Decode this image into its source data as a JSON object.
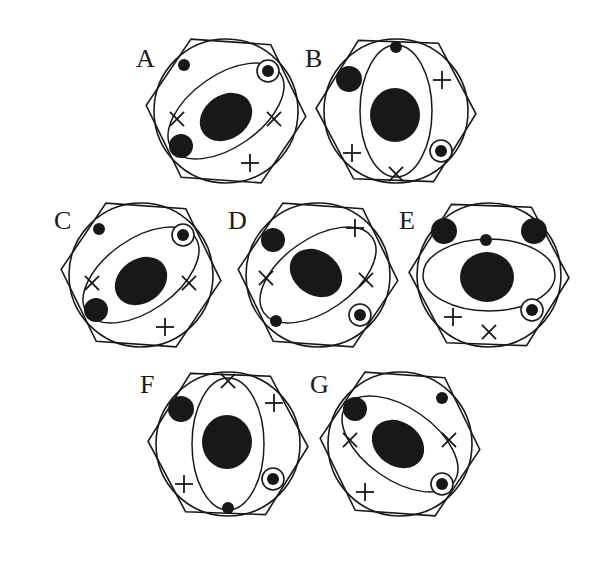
{
  "figure": {
    "background_color": "#ffffff",
    "ink_color": "#181818",
    "panel_count": 7,
    "label_font_style": "serif-capital"
  },
  "panels": [
    {
      "id": "A",
      "label": "A",
      "label_x": 136,
      "label_y": 46,
      "center_x": 226,
      "center_y": 111,
      "circle_radius": 72,
      "hex_radius": 80,
      "hex_rotation_deg": 4,
      "core": {
        "rx": 28,
        "ry": 22,
        "rot": -35,
        "cx": 0,
        "cy": 6
      },
      "orbit": {
        "rx": 66,
        "ry": 36,
        "rot": -35
      },
      "small_dot": {
        "x": -42,
        "y": -46,
        "r": 6
      },
      "medium_dot": {
        "x": -45,
        "y": 35,
        "r": 12
      },
      "ring_dot": {
        "x": 42,
        "y": -40,
        "r_outer": 11,
        "r_inner": 6
      },
      "marks": [
        {
          "glyph": "×",
          "x": -49,
          "y": 8
        },
        {
          "glyph": "×",
          "x": 48,
          "y": 8
        },
        {
          "glyph": "+",
          "x": 24,
          "y": 52
        }
      ]
    },
    {
      "id": "B",
      "label": "B",
      "label_x": 305,
      "label_y": 46,
      "center_x": 396,
      "center_y": 111,
      "circle_radius": 72,
      "hex_radius": 80,
      "hex_rotation_deg": 2,
      "core": {
        "rx": 25,
        "ry": 27,
        "rot": 0,
        "cx": -1,
        "cy": 4
      },
      "orbit": {
        "rx": 36,
        "ry": 66,
        "rot": 0
      },
      "small_dot": {
        "x": 0,
        "y": -64,
        "r": 6
      },
      "medium_dot": {
        "x": -47,
        "y": -32,
        "r": 13
      },
      "ring_dot": {
        "x": 45,
        "y": 40,
        "r_outer": 11,
        "r_inner": 6
      },
      "marks": [
        {
          "glyph": "+",
          "x": 46,
          "y": -31
        },
        {
          "glyph": "+",
          "x": -44,
          "y": 42
        },
        {
          "glyph": "×",
          "x": 0,
          "y": 63
        }
      ]
    },
    {
      "id": "C",
      "label": "C",
      "label_x": 54,
      "label_y": 208,
      "center_x": 141,
      "center_y": 275,
      "circle_radius": 72,
      "hex_radius": 80,
      "hex_rotation_deg": 4,
      "core": {
        "rx": 28,
        "ry": 22,
        "rot": -35,
        "cx": 0,
        "cy": 6
      },
      "orbit": {
        "rx": 66,
        "ry": 36,
        "rot": -35
      },
      "small_dot": {
        "x": -42,
        "y": -46,
        "r": 6
      },
      "medium_dot": {
        "x": -45,
        "y": 35,
        "r": 12
      },
      "ring_dot": {
        "x": 42,
        "y": -40,
        "r_outer": 11,
        "r_inner": 6
      },
      "marks": [
        {
          "glyph": "×",
          "x": -49,
          "y": 8
        },
        {
          "glyph": "×",
          "x": 48,
          "y": 8
        },
        {
          "glyph": "+",
          "x": 24,
          "y": 52
        }
      ]
    },
    {
      "id": "D",
      "label": "D",
      "label_x": 228,
      "label_y": 208,
      "center_x": 318,
      "center_y": 275,
      "circle_radius": 72,
      "hex_radius": 80,
      "hex_rotation_deg": 4,
      "core": {
        "rx": 28,
        "ry": 22,
        "rot": 35,
        "cx": -2,
        "cy": -2
      },
      "orbit": {
        "rx": 66,
        "ry": 36,
        "rot": -35
      },
      "small_dot": {
        "x": -42,
        "y": 46,
        "r": 6
      },
      "medium_dot": {
        "x": -45,
        "y": -35,
        "r": 12
      },
      "ring_dot": {
        "x": 42,
        "y": 40,
        "r_outer": 11,
        "r_inner": 6
      },
      "marks": [
        {
          "glyph": "×",
          "x": -52,
          "y": 3
        },
        {
          "glyph": "×",
          "x": 48,
          "y": 5
        },
        {
          "glyph": "+",
          "x": 37,
          "y": -47
        }
      ]
    },
    {
      "id": "E",
      "label": "E",
      "label_x": 399,
      "label_y": 208,
      "center_x": 489,
      "center_y": 275,
      "circle_radius": 72,
      "hex_radius": 80,
      "hex_rotation_deg": 2,
      "core": {
        "rx": 27,
        "ry": 25,
        "rot": 0,
        "cx": -2,
        "cy": 2
      },
      "orbit": {
        "rx": 66,
        "ry": 36,
        "rot": 0
      },
      "small_dot": {
        "x": -3,
        "y": -35,
        "r": 6
      },
      "medium_dot": {
        "x": -45,
        "y": -44,
        "r": 13
      },
      "ring_dot": {
        "x": 43,
        "y": 35,
        "r_outer": 11,
        "r_inner": 6
      },
      "marks": [
        {
          "glyph": "+",
          "x": -36,
          "y": 42
        },
        {
          "glyph": "×",
          "x": 0,
          "y": 57
        }
      ],
      "extra_dots": [
        {
          "x": 45,
          "y": -44,
          "r": 13
        }
      ]
    },
    {
      "id": "F",
      "label": "F",
      "label_x": 140,
      "label_y": 372,
      "center_x": 228,
      "center_y": 444,
      "circle_radius": 72,
      "hex_radius": 80,
      "hex_rotation_deg": 2,
      "core": {
        "rx": 25,
        "ry": 27,
        "rot": 0,
        "cx": -1,
        "cy": -2
      },
      "orbit": {
        "rx": 36,
        "ry": 66,
        "rot": 0
      },
      "small_dot": {
        "x": 0,
        "y": 64,
        "r": 6
      },
      "medium_dot": {
        "x": -47,
        "y": -35,
        "r": 13
      },
      "ring_dot": {
        "x": 45,
        "y": 35,
        "r_outer": 11,
        "r_inner": 6
      },
      "marks": [
        {
          "glyph": "×",
          "x": 0,
          "y": -63
        },
        {
          "glyph": "+",
          "x": 46,
          "y": -41
        },
        {
          "glyph": "+",
          "x": -44,
          "y": 40
        }
      ]
    },
    {
      "id": "G",
      "label": "G",
      "label_x": 310,
      "label_y": 372,
      "center_x": 400,
      "center_y": 444,
      "circle_radius": 72,
      "hex_radius": 80,
      "hex_rotation_deg": 4,
      "core": {
        "rx": 28,
        "ry": 22,
        "rot": 35,
        "cx": -2,
        "cy": 0
      },
      "orbit": {
        "rx": 66,
        "ry": 36,
        "rot": 35
      },
      "small_dot": {
        "x": 42,
        "y": -46,
        "r": 6
      },
      "medium_dot": {
        "x": -45,
        "y": -35,
        "r": 12
      },
      "ring_dot": {
        "x": 42,
        "y": 40,
        "r_outer": 11,
        "r_inner": 6
      },
      "marks": [
        {
          "glyph": "×",
          "x": -50,
          "y": -4
        },
        {
          "glyph": "×",
          "x": 49,
          "y": -4
        },
        {
          "glyph": "+",
          "x": -35,
          "y": 48
        }
      ]
    }
  ]
}
